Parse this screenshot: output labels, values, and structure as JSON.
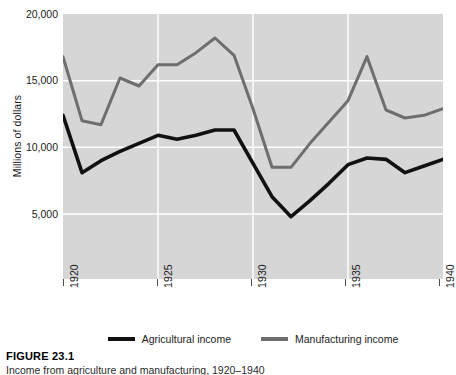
{
  "figure": {
    "caption_title": "FIGURE 23.1",
    "caption_subtitle": "Income from agriculture and manufacturing, 1920–1940"
  },
  "axes": {
    "ylabel": "Millions of dollars",
    "y_ticks": [
      "20,000",
      "15,000",
      "10,000",
      "5,000"
    ],
    "x_ticks": [
      "1920",
      "1925",
      "1930",
      "1935",
      "1940"
    ]
  },
  "legend": {
    "entries": [
      {
        "label": "Agricultural income",
        "color": "#111111"
      },
      {
        "label": "Manufacturing income",
        "color": "#6e6e6e"
      }
    ]
  },
  "colors": {
    "plot_background": "#d6d6d6",
    "gridline": "#ffffff",
    "agricultural": "#111111",
    "manufacturing": "#6e6e6e",
    "axis": "#4a4a4a"
  },
  "chart_data": {
    "type": "line",
    "title": "Income from agriculture and manufacturing, 1920–1940",
    "xlabel": "",
    "ylabel": "Millions of dollars",
    "xlim": [
      1920,
      1940
    ],
    "ylim": [
      0,
      20000
    ],
    "ytick_values": [
      20000,
      15000,
      10000,
      5000
    ],
    "xtick_values": [
      1920,
      1925,
      1930,
      1935,
      1940
    ],
    "grid": true,
    "legend_position": "bottom",
    "x": [
      1920,
      1921,
      1922,
      1923,
      1924,
      1925,
      1926,
      1927,
      1928,
      1929,
      1930,
      1931,
      1932,
      1933,
      1934,
      1935,
      1936,
      1937,
      1938,
      1939,
      1940
    ],
    "series": [
      {
        "name": "Agricultural income",
        "color": "#111111",
        "values": [
          12400,
          8100,
          9000,
          9700,
          10300,
          10900,
          10600,
          10900,
          11300,
          11300,
          8800,
          6300,
          4800,
          6000,
          7300,
          8700,
          9200,
          9100,
          8100,
          8600,
          9100
        ]
      },
      {
        "name": "Manufacturing income",
        "color": "#6e6e6e",
        "values": [
          16800,
          12000,
          11700,
          15200,
          14600,
          16200,
          16200,
          17100,
          18200,
          16900,
          12900,
          8500,
          8500,
          10300,
          11900,
          13500,
          16800,
          12800,
          12200,
          12400,
          12900
        ]
      }
    ]
  }
}
